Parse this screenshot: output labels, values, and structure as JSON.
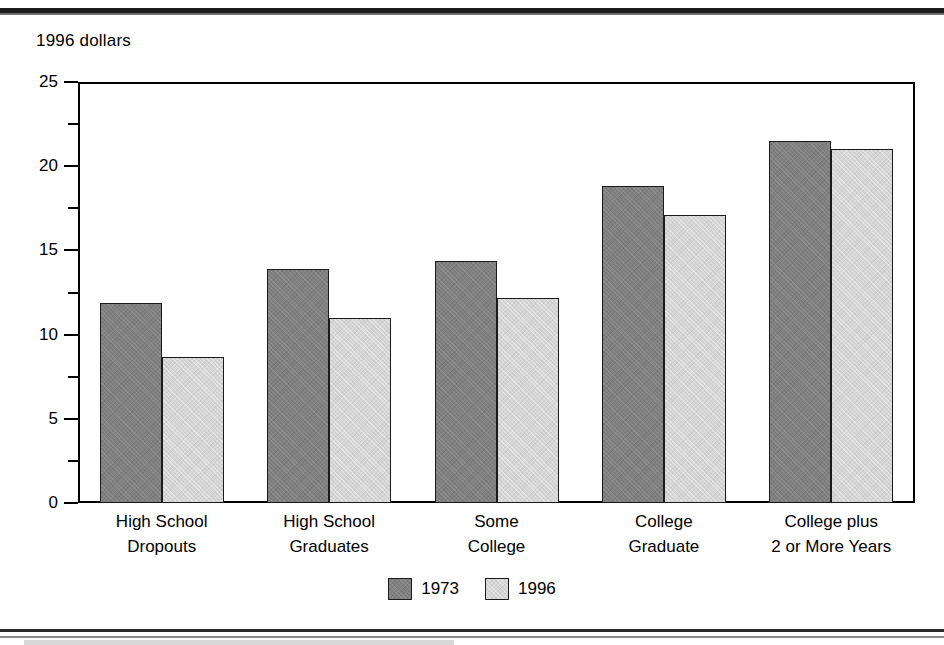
{
  "chart_data": {
    "type": "bar",
    "title": "",
    "subtitle": "",
    "ylabel": "1996 dollars",
    "xlabel": "",
    "ylim": [
      0,
      25
    ],
    "ytick_labels": [
      "0",
      "5",
      "10",
      "15",
      "20",
      "25"
    ],
    "ytick_values": [
      0,
      5,
      10,
      15,
      20,
      25
    ],
    "yminor_values": [
      2.5,
      7.5,
      12.5,
      17.5,
      22.5
    ],
    "grid": false,
    "legend_position": "bottom-center",
    "categories": [
      "High School\nDropouts",
      "High School\nGraduates",
      "Some\nCollege",
      "College\nGraduate",
      "College plus\n2 or More Years"
    ],
    "category_lines": [
      [
        "High School",
        "Dropouts"
      ],
      [
        "High School",
        "Graduates"
      ],
      [
        "Some",
        "College"
      ],
      [
        "College",
        "Graduate"
      ],
      [
        "College plus",
        "2 or More Years"
      ]
    ],
    "series": [
      {
        "name": "1973",
        "color": "#808080",
        "values": [
          11.9,
          13.9,
          14.4,
          18.8,
          21.5
        ]
      },
      {
        "name": "1996",
        "color": "#d5d5d5",
        "values": [
          8.7,
          11.0,
          12.2,
          17.1,
          21.0
        ]
      }
    ]
  },
  "axis": {
    "title": "1996 dollars"
  },
  "legend": {
    "items": [
      {
        "label": "1973",
        "swatch": "dark-gray-swatch"
      },
      {
        "label": "1996",
        "swatch": "light-gray-swatch"
      }
    ]
  },
  "colors": {
    "series_1973": "#808080",
    "series_1996": "#d5d5d5",
    "axis": "#000000",
    "background": "#ffffff"
  }
}
